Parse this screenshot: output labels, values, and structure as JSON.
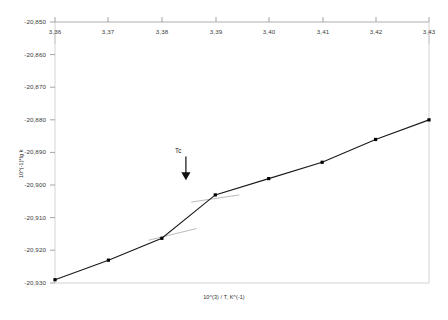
{
  "chart_data": {
    "type": "line",
    "title": "",
    "subtitle": "",
    "xlabel": "10^(3) / T, K^(-1)",
    "ylabel": "10^(-1)*lg k",
    "xlim": [
      3.36,
      3.43
    ],
    "ylim": [
      -20930,
      -20850
    ],
    "xticks": [
      "3,36",
      "3,37",
      "3,38",
      "3,39",
      "3,40",
      "3,41",
      "3,42",
      "3,43"
    ],
    "xtick_values": [
      3.36,
      3.37,
      3.38,
      3.39,
      3.4,
      3.41,
      3.42,
      3.43
    ],
    "yticks": [
      "-20,850",
      "-20,860",
      "-20,870",
      "-20,880",
      "-20,890",
      "-20,900",
      "-20,910",
      "-20,920",
      "-20,930"
    ],
    "ytick_values": [
      -20850,
      -20860,
      -20870,
      -20880,
      -20890,
      -20900,
      -20910,
      -20920,
      -20930
    ],
    "grid": false,
    "legend": null,
    "legend_position": "none",
    "marker": "filled-square",
    "line_color": "#1a1a1a",
    "marker_color": "#000000",
    "guide_color": "#9a9a9a",
    "x": [
      3.36,
      3.37,
      3.38,
      3.39,
      3.4,
      3.41,
      3.42,
      3.43
    ],
    "values": [
      -20929.0,
      -20923.0,
      -20916.3,
      -20903.0,
      -20898.0,
      -20893.0,
      -20886.0,
      -20880.0
    ],
    "series": [
      {
        "name": "lg k vs 1/T",
        "points": [
          {
            "x": 3.36,
            "y": -20929.0
          },
          {
            "x": 3.37,
            "y": -20923.0
          },
          {
            "x": 3.38,
            "y": -20916.3
          },
          {
            "x": 3.39,
            "y": -20903.0
          },
          {
            "x": 3.4,
            "y": -20898.0
          },
          {
            "x": 3.41,
            "y": -20893.0
          },
          {
            "x": 3.42,
            "y": -20886.0
          },
          {
            "x": 3.43,
            "y": -20880.0
          }
        ]
      }
    ],
    "guide_lines": [
      {
        "name": "lower-branch-tangent",
        "x1": 3.3775,
        "y1": -20916.9,
        "x2": 3.3865,
        "y2": -20913.3
      },
      {
        "name": "upper-branch-tangent",
        "x1": 3.3855,
        "y1": -20905.2,
        "x2": 3.3945,
        "y2": -20903.0
      }
    ],
    "annotations": [
      {
        "name": "Tc",
        "label": "Tc",
        "x": 3.3845,
        "y": -20890.0,
        "arrow": "down",
        "arrow_to_y": -20898.5
      }
    ]
  },
  "axis": {
    "x_title": "10^(3) / T, K^(-1)",
    "y_title": "10^(-1)*lg k"
  },
  "annotation": {
    "tc_label": "Tc"
  }
}
